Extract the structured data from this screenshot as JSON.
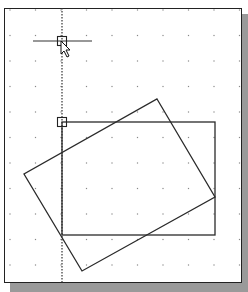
{
  "viewport": {
    "background": "#ffffff",
    "border_color": "#222222",
    "shadow_color": "#9a9a9a"
  },
  "grid": {
    "x_start": 10,
    "y_start": 10,
    "spacing": 25.5,
    "dot_color": "#888888"
  },
  "construction_line": {
    "x": 62,
    "y_from": 8,
    "y_to": 284,
    "style": "dotted"
  },
  "crosshair": {
    "x_from": 33,
    "x_to": 92,
    "y": 41
  },
  "snap_markers": [
    {
      "name": "cursor-snap-marker",
      "cx": 62,
      "cy": 41,
      "size": 9
    },
    {
      "name": "corner-snap-marker",
      "cx": 62,
      "cy": 122,
      "size": 9
    }
  ],
  "shapes": {
    "axis_rectangle": {
      "x": 62,
      "y": 122,
      "width": 153,
      "height": 113
    },
    "rotated_rectangle": {
      "points": [
        [
          157,
          99
        ],
        [
          215,
          197
        ],
        [
          82,
          271
        ],
        [
          24,
          174
        ]
      ]
    }
  },
  "cursor": {
    "x": 61,
    "y": 41,
    "icon": "arrow-pointer-icon"
  }
}
